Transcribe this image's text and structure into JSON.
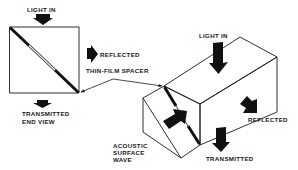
{
  "figure": {
    "colors": {
      "ink": "#1a1a1a",
      "background": "#ffffff"
    },
    "end_view": {
      "light_in_label": "LIGHT IN",
      "reflected_label": "REFLECTED",
      "transmitted_label_line1": "TRANSMITTED",
      "transmitted_label_line2": "END VIEW",
      "icons": {
        "light_in": "arrow-down-icon",
        "reflected": "arrow-right-icon",
        "transmitted": "arrow-down-icon"
      }
    },
    "spacer_callout": {
      "label": "THIN-FILM SPACER"
    },
    "isometric_view": {
      "light_in_label": "LIGHT IN",
      "reflected_label": "REFLECTED",
      "transmitted_label": "TRANSMITTED",
      "acoustic_label_line1": "ACOUSTIC",
      "acoustic_label_line2": "SURFACE",
      "acoustic_label_line3": "WAVE",
      "icons": {
        "light_in": "arrow-down-icon",
        "reflected": "arrow-down-right-icon",
        "transmitted": "arrow-down-icon",
        "acoustic_wave": "arrow-up-right-icon"
      }
    }
  }
}
